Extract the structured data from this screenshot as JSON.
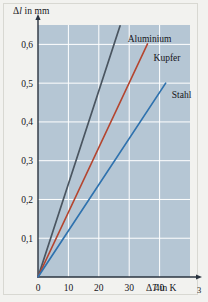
{
  "page": {
    "folio": "3",
    "background_color": "#f2f2ef"
  },
  "figure": {
    "plot_background_color": "#b5c6d4",
    "grid_color": "#ffffff",
    "axis_color": "#2b3440"
  },
  "chart_data": {
    "type": "line",
    "title": "",
    "xlabel": "ΔT in K",
    "ylabel": "Δl in mm",
    "xlabel_parts": {
      "delta": "Δ",
      "symbol": "T",
      "suffix": " in K"
    },
    "ylabel_parts": {
      "delta": "Δ",
      "symbol": "l",
      "suffix": " in mm"
    },
    "x": [
      0,
      10,
      20,
      30,
      40,
      50
    ],
    "xlim": [
      0,
      50
    ],
    "ylim": [
      0,
      0.65
    ],
    "xticks": [
      0,
      10,
      20,
      30,
      40
    ],
    "xtick_labels": [
      "0",
      "10",
      "20",
      "30",
      "40"
    ],
    "yticks": [
      0.1,
      0.2,
      0.3,
      0.4,
      0.5,
      0.6
    ],
    "ytick_labels": [
      "0,1",
      "0,2",
      "0,3",
      "0,4",
      "0,5",
      "0,6"
    ],
    "grid": true,
    "legend_position": "inline-right-of-line-end",
    "series": [
      {
        "name": "Aluminium",
        "color": "#4a5560",
        "slope_mm_per_K": 0.024,
        "x_end": 27.0,
        "y_end": 0.648,
        "points": [
          [
            0,
            0
          ],
          [
            27.0,
            0.648
          ]
        ],
        "label_x": 29.5,
        "label_y": 0.615
      },
      {
        "name": "Kupfer",
        "color": "#b4452f",
        "slope_mm_per_K": 0.0167,
        "x_end": 36.0,
        "y_end": 0.601,
        "points": [
          [
            0,
            0
          ],
          [
            36.0,
            0.601
          ]
        ],
        "label_x": 38.0,
        "label_y": 0.565
      },
      {
        "name": "Stahl",
        "color": "#2f72ae",
        "slope_mm_per_K": 0.0119,
        "x_end": 42.0,
        "y_end": 0.5,
        "points": [
          [
            0,
            0
          ],
          [
            42.0,
            0.5
          ]
        ],
        "label_x": 44.0,
        "label_y": 0.47
      }
    ]
  }
}
